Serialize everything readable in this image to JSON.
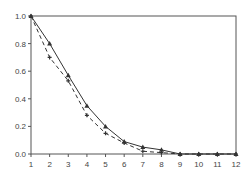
{
  "chart_data": {
    "type": "line",
    "title": "",
    "xlabel": "",
    "ylabel": "",
    "x": [
      1,
      2,
      3,
      4,
      5,
      6,
      7,
      8,
      9,
      10,
      11,
      12
    ],
    "xlim": [
      1,
      12
    ],
    "ylim": [
      0,
      1.0
    ],
    "xticks": [
      "1",
      "2",
      "3",
      "4",
      "5",
      "6",
      "7",
      "8",
      "9",
      "10",
      "11",
      "12"
    ],
    "yticks": [
      "0.0",
      "0.2",
      "0.4",
      "0.6",
      "0.8",
      "1.0"
    ],
    "grid": false,
    "legend": null,
    "series": [
      {
        "name": "solid",
        "style": "solid",
        "marker": "triangle",
        "values": [
          1.0,
          0.8,
          0.57,
          0.35,
          0.2,
          0.09,
          0.05,
          0.03,
          0.0,
          0.0,
          0.0,
          0.0
        ]
      },
      {
        "name": "dashed",
        "style": "dashed",
        "marker": "cross",
        "values": [
          1.0,
          0.7,
          0.53,
          0.28,
          0.15,
          0.08,
          0.02,
          0.01,
          0.0,
          0.0,
          0.0,
          0.0
        ]
      }
    ]
  },
  "colors": {
    "axis": "#555555",
    "line": "#333333",
    "text": "#444444"
  }
}
